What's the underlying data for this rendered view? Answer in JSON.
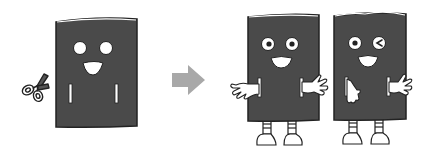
{
  "illustration": {
    "description": "Rectangular mascot with cut slits becomes mascot with arms and legs",
    "before": {
      "label": "mascot-with-slits",
      "expression": "smiling"
    },
    "transition": {
      "icon": "arrow-right-icon"
    },
    "after": [
      {
        "label": "mascot-arms-out",
        "expression": "smiling"
      },
      {
        "label": "mascot-winking",
        "expression": "winking"
      }
    ],
    "tool": {
      "icon": "scissors-icon"
    }
  },
  "colors": {
    "body": "#4a4a4a",
    "outline": "#222222",
    "highlight": "#ffffff",
    "arrow": "#a8a8a8",
    "background": "#ffffff"
  }
}
